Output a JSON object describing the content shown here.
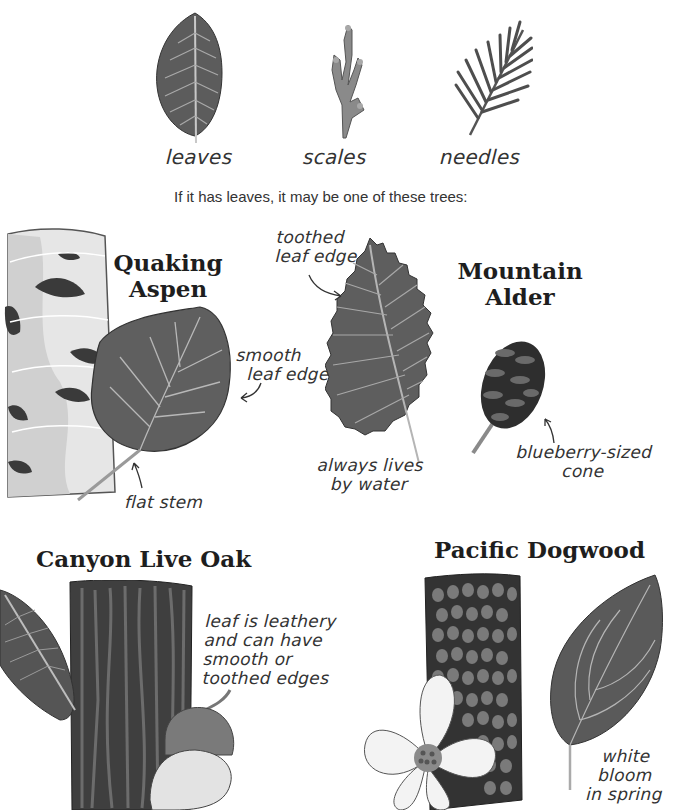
{
  "top_row": {
    "items": [
      {
        "label": "leaves",
        "icon": "broad-leaf-icon"
      },
      {
        "label": "scales",
        "icon": "scale-foliage-icon"
      },
      {
        "label": "needles",
        "icon": "needle-branch-icon"
      }
    ],
    "caption": "If it has leaves, it may be one of these trees:"
  },
  "trees": {
    "aspen": {
      "title_line1": "Quaking",
      "title_line2": "Aspen",
      "notes": {
        "edge_line1": "smooth",
        "edge_line2": "leaf edge",
        "stem": "flat stem"
      }
    },
    "alder": {
      "title_line1": "Mountain",
      "title_line2": "Alder",
      "notes": {
        "edge_line1": "toothed",
        "edge_line2": "leaf edge",
        "water_line1": "always lives",
        "water_line2": "by water",
        "cone_line1": "blueberry-sized",
        "cone_line2": "cone"
      }
    },
    "oak": {
      "title": "Canyon Live Oak",
      "notes": {
        "line1": "leaf is leathery",
        "line2": "and can have",
        "line3": "smooth or",
        "line4": "toothed edges"
      }
    },
    "dogwood": {
      "title": "Pacific Dogwood",
      "notes": {
        "line1": "white bloom",
        "line2": "in spring"
      }
    }
  },
  "colors": {
    "leaf_dark": "#5a5a5a",
    "leaf_vein": "#bdbdbd",
    "bark_dark": "#3c3c3c",
    "aspen_bark": "#e2e2e2",
    "background": "#ffffff"
  }
}
